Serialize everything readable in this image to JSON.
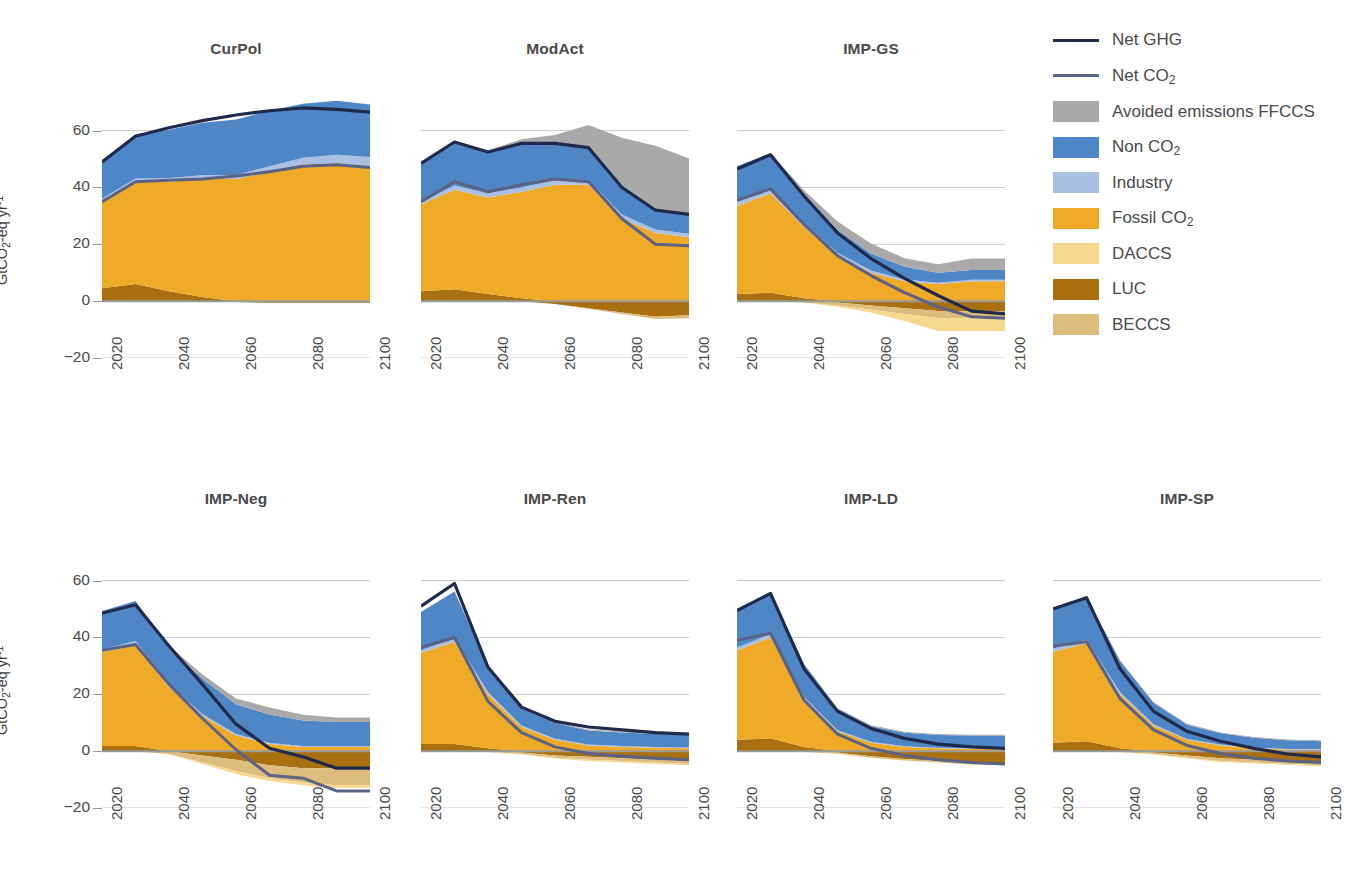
{
  "figure": {
    "y_axis_label": "GtCO2-eq yr-1",
    "y_ticks": [
      60,
      40,
      20,
      0,
      -20
    ],
    "x_ticks": [
      2020,
      2040,
      2060,
      2080,
      2100
    ],
    "ylim": [
      -20,
      75
    ],
    "xlim": [
      2020,
      2100
    ]
  },
  "legend": {
    "position": "top-right",
    "entries": [
      {
        "label": "Net GHG",
        "type": "line",
        "color": "#1f2a4d",
        "width": 3.2
      },
      {
        "label": "Net CO2",
        "type": "line",
        "color": "#5a6285",
        "width": 3.0
      },
      {
        "label": "Avoided emissions FFCCS",
        "type": "area",
        "color": "#a9a9a9"
      },
      {
        "label": "Non CO2",
        "type": "area",
        "color": "#4f86c6"
      },
      {
        "label": "Industry",
        "type": "area",
        "color": "#a9bfe4"
      },
      {
        "label": "Fossil CO2",
        "type": "area",
        "color": "#efab27"
      },
      {
        "label": "DACCS",
        "type": "area",
        "color": "#f6d88f"
      },
      {
        "label": "LUC",
        "type": "area",
        "color": "#a8700f"
      },
      {
        "label": "BECCS",
        "type": "area",
        "color": "#ddbd7d"
      }
    ]
  },
  "chart_data": {
    "type": "area",
    "title": "",
    "xlabel": "",
    "ylabel": "GtCO2-eq yr-1",
    "xlim": [
      2020,
      2100
    ],
    "ylim": [
      -20,
      75
    ],
    "grid": "horizontal",
    "x": [
      2020,
      2030,
      2040,
      2050,
      2060,
      2070,
      2080,
      2090,
      2100
    ],
    "panels": [
      {
        "title": "CurPol",
        "row": 0,
        "col": 0,
        "series": [
          {
            "name": "LUC",
            "values": [
              4.5,
              6.0,
              3.5,
              1.5,
              -0.3,
              -0.6,
              -0.6,
              -0.6,
              -0.6
            ]
          },
          {
            "name": "BECCS",
            "values": [
              0,
              0,
              0,
              0,
              0,
              0,
              0,
              0,
              0
            ]
          },
          {
            "name": "DACCS",
            "values": [
              0,
              0,
              0,
              0,
              0,
              0,
              0,
              0,
              0
            ]
          },
          {
            "name": "Fossil CO2",
            "values": [
              30.5,
              36.0,
              38.5,
              41.5,
              43.0,
              45.5,
              48.0,
              48.5,
              47.5
            ]
          },
          {
            "name": "Industry",
            "values": [
              1.0,
              1.2,
              1.3,
              1.3,
              1.4,
              2.0,
              2.5,
              3.0,
              3.2
            ]
          },
          {
            "name": "Non CO2",
            "values": [
              13.5,
              15.5,
              17.0,
              18.5,
              19.5,
              19.5,
              19.0,
              19.0,
              18.5
            ]
          },
          {
            "name": "Avoided emissions FFCCS",
            "values": [
              0,
              0,
              0,
              0,
              0,
              0,
              0,
              0,
              0
            ]
          }
        ],
        "lines": [
          {
            "name": "Net GHG",
            "values": [
              49.0,
              58.0,
              61.0,
              63.5,
              65.5,
              67.0,
              68.0,
              67.5,
              66.5
            ]
          },
          {
            "name": "Net CO2",
            "values": [
              35.0,
              42.0,
              42.5,
              43.0,
              44.0,
              45.5,
              47.5,
              48.0,
              47.0
            ]
          }
        ]
      },
      {
        "title": "ModAct",
        "row": 0,
        "col": 1,
        "series": [
          {
            "name": "LUC",
            "values": [
              3.5,
              4.2,
              2.5,
              1.0,
              -1.0,
              -2.5,
              -4.0,
              -5.5,
              -5.0
            ]
          },
          {
            "name": "BECCS",
            "values": [
              0,
              0,
              0,
              0,
              0,
              0.3,
              0.5,
              0.8,
              1.0
            ]
          },
          {
            "name": "DACCS",
            "values": [
              0,
              0,
              0,
              0,
              0,
              0,
              0,
              0,
              0
            ]
          },
          {
            "name": "Fossil CO2",
            "values": [
              30.5,
              35.0,
              34.0,
              37.5,
              41.0,
              41.0,
              29.0,
              24.0,
              22.5
            ]
          },
          {
            "name": "Industry",
            "values": [
              1.0,
              1.5,
              1.5,
              1.5,
              1.5,
              1.5,
              1.5,
              1.2,
              1.2
            ]
          },
          {
            "name": "Non CO2",
            "values": [
              13.5,
              15.5,
              14.5,
              15.5,
              13.0,
              11.5,
              9.5,
              7.5,
              7.0
            ]
          },
          {
            "name": "Avoided emissions FFCCS",
            "values": [
              0,
              0,
              0.5,
              1.5,
              3.0,
              8.0,
              17.5,
              22.0,
              19.5
            ]
          }
        ],
        "lines": [
          {
            "name": "Net GHG",
            "values": [
              48.5,
              56.0,
              52.5,
              55.5,
              55.5,
              54.0,
              40.0,
              32.0,
              30.5
            ]
          },
          {
            "name": "Net CO2",
            "values": [
              35.0,
              42.0,
              38.5,
              41.0,
              43.0,
              42.0,
              29.0,
              20.0,
              19.5
            ]
          }
        ]
      },
      {
        "title": "IMP-GS",
        "row": 0,
        "col": 2,
        "series": [
          {
            "name": "LUC",
            "values": [
              2.5,
              3.0,
              1.0,
              -0.5,
              -1.5,
              -2.5,
              -3.5,
              -3.5,
              -3.5
            ]
          },
          {
            "name": "BECCS",
            "values": [
              0,
              0,
              0.5,
              1.0,
              1.5,
              2.0,
              2.5,
              2.5,
              2.5
            ]
          },
          {
            "name": "DACCS",
            "values": [
              0,
              0,
              0,
              0.5,
              1.0,
              2.5,
              4.5,
              4.5,
              4.5
            ]
          },
          {
            "name": "Fossil CO2",
            "values": [
              31.0,
              35.0,
              25.0,
              16.0,
              10.0,
              7.0,
              6.0,
              7.0,
              7.0
            ]
          },
          {
            "name": "Industry",
            "values": [
              1.5,
              2.0,
              1.5,
              1.0,
              0.8,
              0.6,
              0.5,
              0.5,
              0.5
            ]
          },
          {
            "name": "Non CO2",
            "values": [
              12.5,
              12.0,
              10.0,
              8.0,
              6.0,
              4.5,
              3.5,
              3.5,
              3.5
            ]
          },
          {
            "name": "Avoided emissions FFCCS",
            "values": [
              0,
              0,
              1.5,
              3.0,
              3.5,
              3.0,
              3.0,
              4.0,
              4.0
            ]
          }
        ],
        "lines": [
          {
            "name": "Net GHG",
            "values": [
              46.5,
              51.5,
              37.0,
              24.0,
              15.0,
              8.0,
              2.0,
              -3.5,
              -4.5
            ]
          },
          {
            "name": "Net CO2",
            "values": [
              35.5,
              39.5,
              27.0,
              16.0,
              9.0,
              3.0,
              -2.0,
              -5.5,
              -6.0
            ]
          }
        ]
      },
      {
        "title": "IMP-Neg",
        "row": 1,
        "col": 0,
        "series": [
          {
            "name": "LUC",
            "values": [
              1.8,
              1.8,
              0.0,
              -1.5,
              -3.0,
              -5.0,
              -6.0,
              -6.0,
              -6.0
            ]
          },
          {
            "name": "BECCS",
            "values": [
              0,
              0,
              1.0,
              2.5,
              4.0,
              4.5,
              5.0,
              6.0,
              6.0
            ]
          },
          {
            "name": "DACCS",
            "values": [
              0,
              0,
              0,
              0.5,
              1.0,
              1.0,
              1.0,
              1.0,
              1.0
            ]
          },
          {
            "name": "Fossil CO2",
            "values": [
              33.0,
              35.5,
              22.5,
              12.5,
              5.5,
              2.5,
              1.5,
              1.5,
              1.5
            ]
          },
          {
            "name": "Industry",
            "values": [
              1.0,
              1.5,
              1.0,
              0.5,
              0.5,
              0.4,
              0.3,
              0.3,
              0.3
            ]
          },
          {
            "name": "Non CO2",
            "values": [
              13.5,
              14.0,
              13.0,
              12.5,
              10.5,
              10.0,
              9.0,
              8.5,
              8.5
            ]
          },
          {
            "name": "Avoided emissions FFCCS",
            "values": [
              0,
              0,
              0.5,
              1.5,
              2.0,
              2.5,
              2.0,
              1.5,
              1.5
            ]
          }
        ],
        "lines": [
          {
            "name": "Net GHG",
            "values": [
              48.5,
              51.5,
              37.0,
              23.5,
              9.5,
              1.0,
              -2.0,
              -6.0,
              -6.0
            ]
          },
          {
            "name": "Net CO2",
            "values": [
              35.5,
              37.5,
              23.5,
              11.5,
              0.5,
              -8.5,
              -9.5,
              -14.0,
              -14.0
            ]
          }
        ]
      },
      {
        "title": "IMP-Ren",
        "row": 1,
        "col": 1,
        "series": [
          {
            "name": "LUC",
            "values": [
              2.5,
              2.5,
              1.0,
              -0.5,
              -1.5,
              -2.0,
              -2.5,
              -3.0,
              -3.5
            ]
          },
          {
            "name": "BECCS",
            "values": [
              0,
              0,
              0.3,
              0.5,
              0.8,
              1.0,
              1.0,
              1.0,
              1.0
            ]
          },
          {
            "name": "DACCS",
            "values": [
              0,
              0,
              0,
              0.2,
              0.3,
              0.5,
              0.5,
              0.5,
              0.5
            ]
          },
          {
            "name": "Fossil CO2",
            "values": [
              32.0,
              36.0,
              19.0,
              8.5,
              4.0,
              2.0,
              1.5,
              1.2,
              1.0
            ]
          },
          {
            "name": "Industry",
            "values": [
              1.0,
              1.2,
              0.8,
              0.5,
              0.4,
              0.3,
              0.3,
              0.3,
              0.3
            ]
          },
          {
            "name": "Non CO2",
            "values": [
              13.5,
              16.5,
              9.0,
              6.0,
              5.5,
              5.0,
              4.8,
              4.5,
              4.5
            ]
          },
          {
            "name": "Avoided emissions FFCCS",
            "values": [
              0,
              0,
              0.2,
              0.3,
              0.3,
              0.3,
              0.3,
              0.3,
              0.3
            ]
          }
        ],
        "lines": [
          {
            "name": "Net GHG",
            "values": [
              51.0,
              59.0,
              29.5,
              15.5,
              10.5,
              8.5,
              7.5,
              6.5,
              6.0
            ]
          },
          {
            "name": "Net CO2",
            "values": [
              36.5,
              40.0,
              17.5,
              6.5,
              1.5,
              -0.8,
              -1.8,
              -2.5,
              -3.0
            ]
          }
        ]
      },
      {
        "title": "IMP-LD",
        "row": 1,
        "col": 2,
        "series": [
          {
            "name": "LUC",
            "values": [
              4.0,
              4.5,
              1.5,
              -0.5,
              -1.8,
              -2.8,
              -3.5,
              -4.2,
              -4.5
            ]
          },
          {
            "name": "BECCS",
            "values": [
              0,
              0,
              0.2,
              0.4,
              0.5,
              0.5,
              0.5,
              0.5,
              0.5
            ]
          },
          {
            "name": "DACCS",
            "values": [
              0,
              0,
              0,
              0,
              0,
              0,
              0,
              0,
              0
            ]
          },
          {
            "name": "Fossil CO2",
            "values": [
              31.5,
              35.5,
              17.0,
              7.0,
              3.0,
              1.5,
              1.0,
              0.8,
              0.8
            ]
          },
          {
            "name": "Industry",
            "values": [
              1.0,
              1.2,
              0.6,
              0.4,
              0.3,
              0.2,
              0.2,
              0.2,
              0.2
            ]
          },
          {
            "name": "Non CO2",
            "values": [
              13.5,
              14.5,
              11.5,
              7.5,
              5.5,
              4.8,
              4.5,
              4.5,
              4.5
            ]
          },
          {
            "name": "Avoided emissions FFCCS",
            "values": [
              0,
              0,
              0.2,
              0.3,
              0.3,
              0.3,
              0.3,
              0.3,
              0.3
            ]
          }
        ],
        "lines": [
          {
            "name": "Net GHG",
            "values": [
              49.5,
              55.5,
              29.0,
              14.0,
              8.0,
              4.5,
              2.5,
              1.5,
              1.0
            ]
          },
          {
            "name": "Net CO2",
            "values": [
              39.0,
              41.5,
              18.0,
              6.0,
              1.0,
              -1.5,
              -3.0,
              -4.0,
              -4.5
            ]
          }
        ]
      },
      {
        "title": "IMP-SP",
        "row": 1,
        "col": 3,
        "series": [
          {
            "name": "LUC",
            "values": [
              3.0,
              3.5,
              1.0,
              -0.5,
              -1.5,
              -2.5,
              -3.0,
              -3.5,
              -4.0
            ]
          },
          {
            "name": "BECCS",
            "values": [
              0,
              0,
              0.3,
              0.5,
              0.8,
              1.0,
              1.0,
              1.0,
              1.0
            ]
          },
          {
            "name": "DACCS",
            "values": [
              0,
              0,
              0,
              0.2,
              0.3,
              0.3,
              0.3,
              0.3,
              0.3
            ]
          },
          {
            "name": "Fossil CO2",
            "values": [
              32.0,
              34.5,
              19.0,
              9.0,
              4.0,
              2.0,
              1.0,
              0.6,
              0.5
            ]
          },
          {
            "name": "Industry",
            "values": [
              1.0,
              1.2,
              0.8,
              0.5,
              0.3,
              0.3,
              0.2,
              0.2,
              0.2
            ]
          },
          {
            "name": "Non CO2",
            "values": [
              13.5,
              15.0,
              11.0,
              7.5,
              5.0,
              4.0,
              3.5,
              3.0,
              2.8
            ]
          },
          {
            "name": "Avoided emissions FFCCS",
            "values": [
              0,
              0,
              0.2,
              0.3,
              0.3,
              0.3,
              0.3,
              0.3,
              0.3
            ]
          }
        ],
        "lines": [
          {
            "name": "Net GHG",
            "values": [
              50.0,
              54.0,
              29.0,
              14.0,
              7.0,
              3.5,
              1.0,
              -1.0,
              -2.0
            ]
          },
          {
            "name": "Net CO2",
            "values": [
              37.0,
              38.5,
              18.5,
              7.5,
              2.0,
              -0.8,
              -2.5,
              -3.5,
              -4.0
            ]
          }
        ]
      }
    ]
  }
}
